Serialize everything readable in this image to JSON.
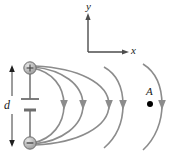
{
  "figure": {
    "type": "physics-field-diagram",
    "width": 179,
    "height": 156,
    "background_color": "#ffffff"
  },
  "axes": {
    "y_label": "y",
    "x_label": "x",
    "origin": {
      "x": 88,
      "y": 52
    },
    "y_tip": {
      "x": 88,
      "y": 15
    },
    "x_tip": {
      "x": 128,
      "y": 52
    },
    "color": "#4d4d4d"
  },
  "source": {
    "positive_terminal": {
      "label": "+",
      "cx": 30,
      "cy": 68,
      "r": 6,
      "fill": "#b0b0b0",
      "stroke": "#6e6e6e"
    },
    "negative_terminal": {
      "label": "−",
      "cx": 30,
      "cy": 143,
      "r": 6,
      "fill": "#b0b0b0",
      "stroke": "#6e6e6e"
    },
    "separation_label": "d",
    "battery_symbol": {
      "long_plate_y": 99,
      "short_plate_y": 110,
      "center_x": 30
    }
  },
  "point": {
    "label": "A",
    "cx": 150,
    "cy": 104,
    "r": 3,
    "color": "#000000"
  },
  "field_lines": {
    "color": "#8c8c8c",
    "arrow_color": "#8c8c8c",
    "stroke_width": 1.6,
    "closed_loops": 3,
    "open_arcs": 2,
    "arrow_direction": "downward",
    "arrow_positions_x": [
      62,
      81,
      107,
      121,
      160
    ]
  }
}
